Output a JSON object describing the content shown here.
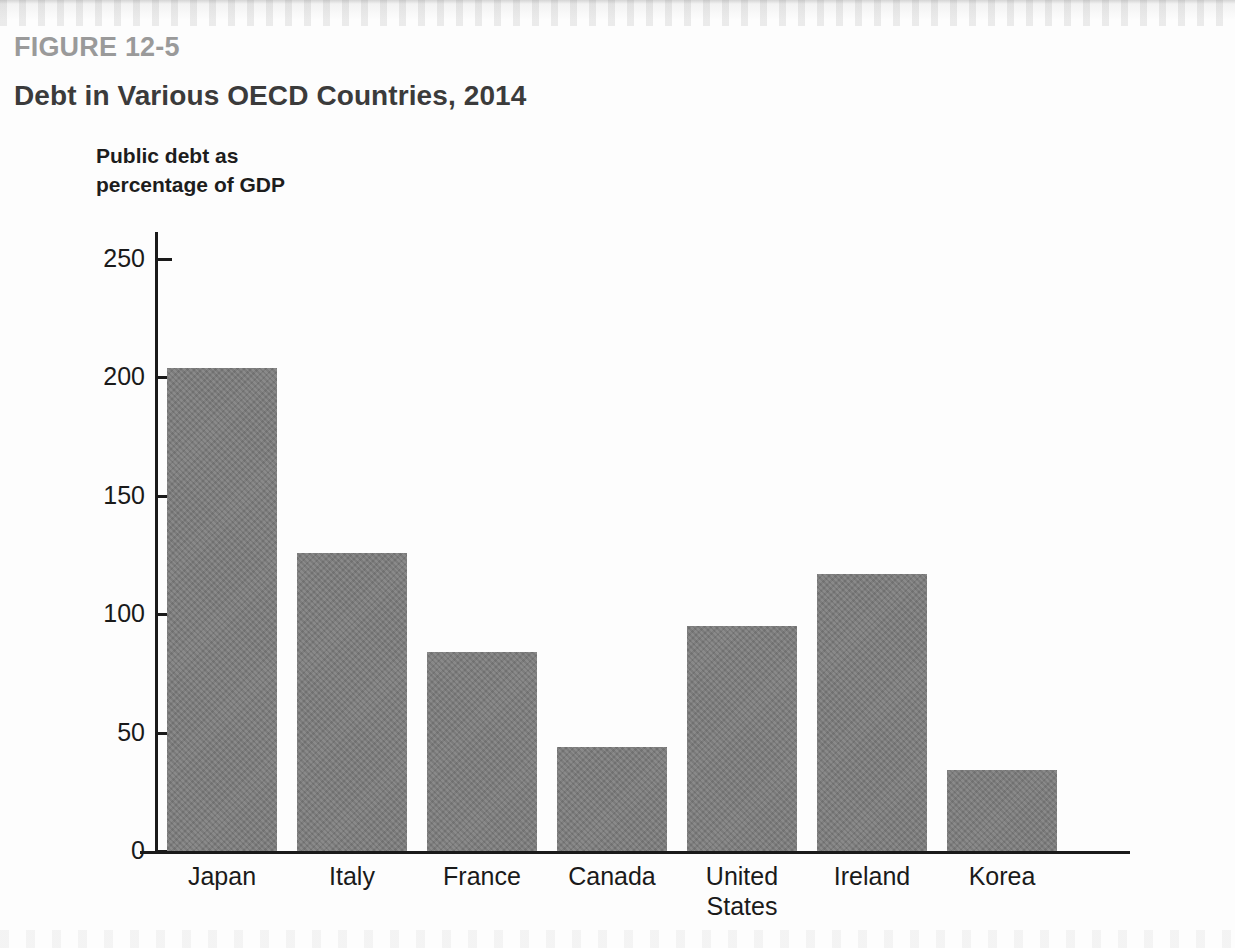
{
  "figure": {
    "number": "FIGURE 12-5",
    "title": "Debt in Various OECD Countries, 2014"
  },
  "colors": {
    "bar_fill": "#7c7c7c",
    "axis": "#1a1a1a",
    "figure_number_text": "#9a9a9a",
    "title_text": "#3b3b3b",
    "label_text": "#1a1a1a",
    "background": "#fdfdfd"
  },
  "chart_data": {
    "type": "bar",
    "title": "Debt in Various OECD Countries, 2014",
    "subtitle": "FIGURE 12-5",
    "ylabel": "Public debt as percentage of GDP",
    "xlabel": "",
    "ylim": [
      0,
      250
    ],
    "yticks": [
      0,
      50,
      100,
      150,
      200,
      250
    ],
    "ytick_labels": [
      "0",
      "50",
      "100",
      "150",
      "200",
      "250"
    ],
    "grid": false,
    "legend": false,
    "categories": [
      "Japan",
      "Italy",
      "France",
      "Canada",
      "United States",
      "Ireland",
      "Korea"
    ],
    "values": [
      204,
      126,
      84,
      44,
      95,
      117,
      34
    ],
    "series": [
      {
        "name": "Public debt as percentage of GDP",
        "values": [
          204,
          126,
          84,
          44,
          95,
          117,
          34
        ]
      }
    ]
  }
}
